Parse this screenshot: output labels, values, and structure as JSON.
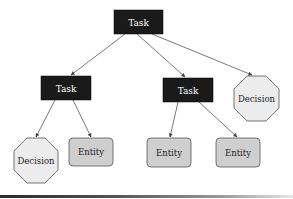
{
  "diagram": {
    "nodes": [
      {
        "id": "root",
        "type": "task",
        "label": "Task"
      },
      {
        "id": "task_left",
        "type": "task",
        "label": "Task"
      },
      {
        "id": "task_middle",
        "type": "task",
        "label": "Task"
      },
      {
        "id": "decision_right",
        "type": "decision",
        "label": "Decision"
      },
      {
        "id": "decision_left",
        "type": "decision",
        "label": "Decision"
      },
      {
        "id": "entity_1",
        "type": "entity",
        "label": "Entity"
      },
      {
        "id": "entity_2",
        "type": "entity",
        "label": "Entity"
      },
      {
        "id": "entity_3",
        "type": "entity",
        "label": "Entity"
      }
    ],
    "edges": [
      {
        "from": "root",
        "to": "task_left"
      },
      {
        "from": "root",
        "to": "task_middle"
      },
      {
        "from": "root",
        "to": "decision_right"
      },
      {
        "from": "task_left",
        "to": "decision_left"
      },
      {
        "from": "task_left",
        "to": "entity_1"
      },
      {
        "from": "task_middle",
        "to": "entity_2"
      },
      {
        "from": "task_middle",
        "to": "entity_3"
      }
    ],
    "colors": {
      "task_fill": "#1a1a1a",
      "task_text": "#ffffff",
      "decision_fill": "#ececec",
      "decision_stroke": "#555555",
      "entity_fill": "#cfcfcf",
      "entity_stroke": "#555555",
      "edge": "#555555"
    }
  }
}
